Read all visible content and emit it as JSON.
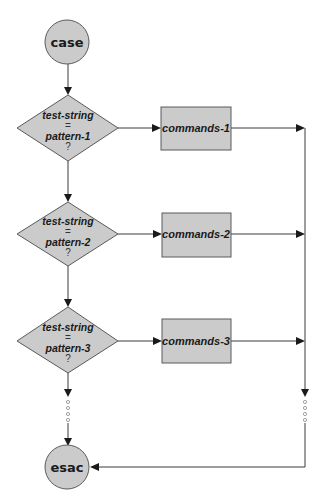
{
  "diagram": {
    "type": "flowchart",
    "title": "",
    "colors": {
      "shape_fill": "#cbcbcb",
      "shape_stroke": "#5a5a5a",
      "line": "#3a3a3a",
      "background": "#ffffff"
    },
    "start": {
      "label": "case",
      "shape": "circle"
    },
    "end": {
      "label": "esac",
      "shape": "circle"
    },
    "branches": [
      {
        "condition": {
          "line1": "test-string",
          "op": "=",
          "line2": "pattern-1",
          "q": "?"
        },
        "action": {
          "label": "commands-1"
        }
      },
      {
        "condition": {
          "line1": "test-string",
          "op": "=",
          "line2": "pattern-2",
          "q": "?"
        },
        "action": {
          "label": "commands-2"
        }
      },
      {
        "condition": {
          "line1": "test-string",
          "op": "=",
          "line2": "pattern-3",
          "q": "?"
        },
        "action": {
          "label": "commands-3"
        }
      }
    ],
    "continuation_marker": "dotted (more patterns omitted)"
  }
}
